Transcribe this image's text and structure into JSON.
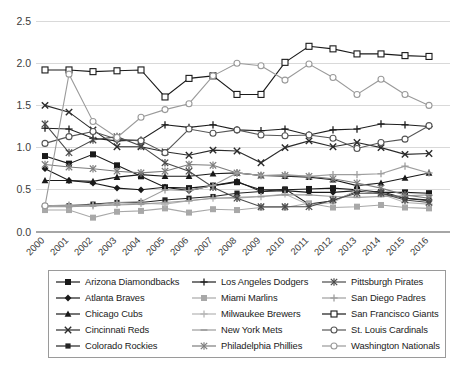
{
  "chart_data": {
    "type": "line",
    "title": "",
    "xlabel": "",
    "ylabel": "",
    "x": [
      2000,
      2001,
      2002,
      2003,
      2004,
      2005,
      2006,
      2007,
      2008,
      2009,
      2010,
      2011,
      2012,
      2013,
      2014,
      2015,
      2016
    ],
    "xtick_labels": [
      "2000",
      "2001",
      "2002",
      "2003",
      "2004",
      "2005",
      "2006",
      "2007",
      "2008",
      "2009",
      "2010",
      "2011",
      "2012",
      "2013",
      "2014",
      "2015",
      "2016"
    ],
    "ytick_labels": [
      "0.0",
      "0.5",
      "1.0",
      "1.5",
      "2.0",
      "2.5"
    ],
    "ytick_values": [
      0.0,
      0.5,
      1.0,
      1.5,
      2.0,
      2.5
    ],
    "ylim": [
      0.0,
      2.5
    ],
    "grid": true,
    "legend_position": "bottom",
    "legend_columns": 3,
    "series": [
      {
        "name": "Arizona Diamondbacks",
        "marker": "square-filled",
        "color": "#1a1a1a",
        "values": [
          0.9,
          0.81,
          0.92,
          0.79,
          0.66,
          0.53,
          0.52,
          0.55,
          0.59,
          0.5,
          0.5,
          0.51,
          0.52,
          0.5,
          0.47,
          0.47,
          0.46
        ]
      },
      {
        "name": "Atlanta Braves",
        "marker": "diamond-filled",
        "color": "#1a1a1a",
        "values": [
          0.75,
          0.61,
          0.58,
          0.52,
          0.5,
          0.53,
          0.49,
          0.55,
          0.6,
          0.48,
          0.49,
          0.47,
          0.47,
          0.49,
          0.46,
          0.4,
          0.37
        ]
      },
      {
        "name": "Chicago Cubs",
        "marker": "triangle-filled",
        "color": "#1a1a1a",
        "values": [
          0.61,
          0.61,
          0.6,
          0.65,
          0.68,
          0.66,
          0.66,
          0.69,
          0.7,
          0.67,
          0.66,
          0.65,
          0.62,
          0.55,
          0.58,
          0.64,
          0.7
        ]
      },
      {
        "name": "Cincinnati Reds",
        "marker": "x",
        "color": "#2b2b2b",
        "values": [
          1.5,
          1.42,
          1.21,
          1.01,
          1.01,
          0.95,
          0.91,
          0.97,
          0.96,
          0.82,
          1.0,
          1.08,
          1.01,
          1.06,
          1.0,
          0.92,
          0.93
        ]
      },
      {
        "name": "Colorado Rockies",
        "marker": "square-filled-small",
        "color": "#242424",
        "values": [
          0.31,
          0.31,
          0.33,
          0.35,
          0.35,
          0.38,
          0.4,
          0.42,
          0.46,
          0.48,
          0.51,
          0.33,
          0.37,
          0.48,
          0.48,
          0.4,
          0.38
        ]
      },
      {
        "name": "Los Angeles Dodgers",
        "marker": "plus",
        "color": "#1f1f1f",
        "values": [
          1.23,
          1.22,
          1.11,
          1.08,
          1.09,
          1.27,
          1.24,
          1.27,
          1.21,
          1.2,
          1.22,
          1.15,
          1.21,
          1.22,
          1.28,
          1.27,
          1.25
        ]
      },
      {
        "name": "Miami Marlins",
        "marker": "square-filled-gray",
        "color": "#a8a8a8",
        "values": [
          0.26,
          0.26,
          0.17,
          0.24,
          0.25,
          0.28,
          0.23,
          0.27,
          0.26,
          0.29,
          0.29,
          0.34,
          0.29,
          0.3,
          0.32,
          0.29,
          0.28
        ]
      },
      {
        "name": "Milwaukee Brewers",
        "marker": "plus-gray",
        "color": "#b5b5b5",
        "values": [
          0.3,
          0.31,
          0.31,
          0.33,
          0.34,
          0.33,
          0.37,
          0.4,
          0.4,
          0.42,
          0.45,
          0.32,
          0.35,
          0.5,
          0.45,
          0.35,
          0.33
        ]
      },
      {
        "name": "New York Mets",
        "marker": "dash-gray",
        "color": "#9c9c9c",
        "values": [
          0.3,
          0.3,
          0.31,
          0.32,
          0.33,
          0.35,
          0.37,
          0.4,
          0.41,
          0.42,
          0.44,
          0.44,
          0.42,
          0.41,
          0.42,
          0.43,
          0.44
        ]
      },
      {
        "name": "Philadelphia Phillies",
        "marker": "asterisk-gray",
        "color": "#7d7d7d",
        "values": [
          0.8,
          0.77,
          0.75,
          0.72,
          0.7,
          0.72,
          0.8,
          0.79,
          0.7,
          0.67,
          0.67,
          0.66,
          0.63,
          0.58,
          0.52,
          0.44,
          0.4
        ]
      },
      {
        "name": "Pittsburgh Pirates",
        "marker": "asterisk",
        "color": "#4a4a4a",
        "values": [
          1.28,
          0.94,
          1.09,
          1.13,
          1.02,
          0.82,
          0.72,
          0.53,
          0.4,
          0.3,
          0.3,
          0.3,
          0.38,
          0.46,
          0.46,
          0.38,
          0.35
        ]
      },
      {
        "name": "San Diego Padres",
        "marker": "plus-gray-light",
        "color": "#9e9e9e",
        "values": [
          0.31,
          0.32,
          0.32,
          0.35,
          0.36,
          0.5,
          0.49,
          0.55,
          0.7,
          0.67,
          0.68,
          0.66,
          0.68,
          0.68,
          0.69,
          0.78,
          0.7
        ]
      },
      {
        "name": "San Francisco Giants",
        "marker": "square-open",
        "color": "#1a1a1a",
        "values": [
          1.92,
          1.92,
          1.9,
          1.91,
          1.92,
          1.6,
          1.82,
          1.85,
          1.63,
          1.63,
          2.01,
          2.2,
          2.17,
          2.11,
          2.11,
          2.09,
          2.08
        ]
      },
      {
        "name": "St. Louis Cardinals",
        "marker": "circle-open",
        "color": "#555555",
        "values": [
          1.05,
          1.13,
          1.19,
          1.1,
          1.08,
          0.94,
          1.22,
          1.17,
          1.21,
          1.15,
          1.14,
          1.15,
          1.11,
          0.99,
          1.06,
          1.1,
          1.26
        ]
      },
      {
        "name": "Washington Nationals",
        "marker": "circle-open-gray",
        "color": "#9a9a9a",
        "values": [
          0.31,
          1.87,
          1.31,
          1.12,
          1.36,
          1.45,
          1.52,
          1.85,
          2.0,
          1.97,
          1.8,
          1.99,
          1.83,
          1.63,
          1.81,
          1.63,
          1.5
        ]
      }
    ]
  },
  "legend": {
    "entries": [
      {
        "label": "Arizona Diamondbacks"
      },
      {
        "label": "Atlanta Braves"
      },
      {
        "label": "Chicago Cubs"
      },
      {
        "label": "Cincinnati Reds"
      },
      {
        "label": "Colorado Rockies"
      },
      {
        "label": "Los Angeles Dodgers"
      },
      {
        "label": "Miami Marlins"
      },
      {
        "label": "Milwaukee Brewers"
      },
      {
        "label": "New York Mets"
      },
      {
        "label": "Philadelphia Phillies"
      },
      {
        "label": "Pittsburgh Pirates"
      },
      {
        "label": "San Diego Padres"
      },
      {
        "label": "San Francisco Giants"
      },
      {
        "label": "St. Louis Cardinals"
      },
      {
        "label": "Washington Nationals"
      }
    ]
  },
  "colors": {
    "grid": "#d9d9d9",
    "axis": "#a6a6a6",
    "text": "#3b3b3b",
    "legend_border": "#9a9a9a",
    "background": "#ffffff"
  }
}
